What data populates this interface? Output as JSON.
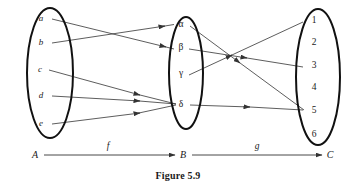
{
  "figure": {
    "caption": "Figure 5.9"
  },
  "sets": [
    {
      "id": "A",
      "label": "A",
      "cx": 50,
      "cy": 73,
      "rx": 23,
      "ry": 65,
      "elements": [
        {
          "name": "a",
          "x": 41,
          "y": 21,
          "style": "italic"
        },
        {
          "name": "b",
          "x": 41,
          "y": 45,
          "style": "italic"
        },
        {
          "name": "c",
          "x": 40,
          "y": 72,
          "style": "italic"
        },
        {
          "name": "d",
          "x": 41,
          "y": 98,
          "style": "italic"
        },
        {
          "name": "e",
          "x": 41,
          "y": 126,
          "style": "italic"
        }
      ]
    },
    {
      "id": "B",
      "label": "B",
      "cx": 186,
      "cy": 73,
      "rx": 17,
      "ry": 56,
      "elements": [
        {
          "name": "α",
          "x": 180,
          "y": 27,
          "style": "greek"
        },
        {
          "name": "β",
          "x": 180,
          "y": 50,
          "style": "greek"
        },
        {
          "name": "γ",
          "x": 180,
          "y": 76,
          "style": "greek"
        },
        {
          "name": "δ",
          "x": 180,
          "y": 105,
          "style": "greek"
        }
      ]
    },
    {
      "id": "C",
      "label": "C",
      "cx": 318,
      "cy": 77,
      "rx": 22,
      "ry": 68,
      "elements": [
        {
          "name": "1",
          "x": 313,
          "y": 23,
          "style": "numeral"
        },
        {
          "name": "2",
          "x": 313,
          "y": 45,
          "style": "numeral"
        },
        {
          "name": "3",
          "x": 313,
          "y": 68,
          "style": "numeral"
        },
        {
          "name": "4",
          "x": 313,
          "y": 90,
          "style": "numeral"
        },
        {
          "name": "5",
          "x": 313,
          "y": 111,
          "style": "numeral"
        },
        {
          "name": "6",
          "x": 313,
          "y": 136,
          "style": "numeral"
        }
      ]
    }
  ],
  "mappings": [
    {
      "name": "f",
      "label": "f",
      "from_set": "A",
      "to_set": "B",
      "arrows": [
        {
          "from": "a",
          "to": "β",
          "x1": 52,
          "y1": 19,
          "x2": 172,
          "y2": 48
        },
        {
          "from": "b",
          "to": "α",
          "x1": 52,
          "y1": 43,
          "x2": 173,
          "y2": 25
        },
        {
          "from": "c",
          "to": "δ",
          "x1": 49,
          "y1": 70,
          "x2": 174,
          "y2": 104
        },
        {
          "from": "d",
          "to": "δ",
          "x1": 52,
          "y1": 96,
          "x2": 174,
          "y2": 104
        },
        {
          "from": "e",
          "to": "δ",
          "x1": 52,
          "y1": 124,
          "x2": 174,
          "y2": 105
        }
      ]
    },
    {
      "name": "g",
      "label": "g",
      "from_set": "B",
      "to_set": "C",
      "arrows": [
        {
          "from": "α",
          "to": "5",
          "x1": 190,
          "y1": 26,
          "x2": 304,
          "y2": 110
        },
        {
          "from": "β",
          "to": "3",
          "x1": 189,
          "y1": 49,
          "x2": 303,
          "y2": 67
        },
        {
          "from": "γ",
          "to": "1",
          "x1": 189,
          "y1": 75,
          "x2": 303,
          "y2": 22
        },
        {
          "from": "δ",
          "to": "5",
          "x1": 190,
          "y1": 105,
          "x2": 303,
          "y2": 110
        }
      ]
    }
  ],
  "axis": {
    "nodes": [
      {
        "id": "A",
        "label": "A",
        "x": 35,
        "y": 158
      },
      {
        "id": "B",
        "label": "B",
        "x": 183,
        "y": 158
      },
      {
        "id": "C",
        "label": "C",
        "x": 330,
        "y": 158
      }
    ],
    "segments": [
      {
        "label": "f",
        "x1": 44,
        "y1": 155,
        "x2": 175,
        "y2": 155,
        "label_x": 108,
        "label_y": 148
      },
      {
        "label": "g",
        "x1": 192,
        "y1": 155,
        "x2": 322,
        "y2": 155,
        "label_x": 257,
        "label_y": 148
      }
    ]
  },
  "colors": {
    "ink": "#1a1a1a",
    "ellipse_stroke": "#111111",
    "line_stroke": "#333333",
    "background": "#ffffff"
  }
}
